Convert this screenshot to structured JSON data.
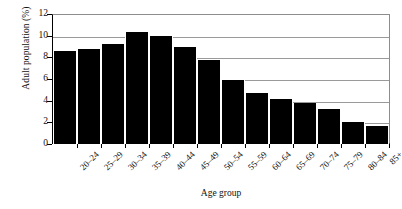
{
  "chart_data": {
    "type": "bar",
    "title": "",
    "xlabel": "Age group",
    "ylabel": "Adult population (%)",
    "categories": [
      "20–24",
      "25–29",
      "30–34",
      "35–39",
      "40–44",
      "45–49",
      "50–54",
      "55–59",
      "60–64",
      "65–69",
      "70–74",
      "75–79",
      "80–84",
      "85+"
    ],
    "values": [
      8.6,
      8.8,
      9.25,
      10.3,
      10.0,
      8.95,
      7.8,
      5.9,
      4.75,
      4.2,
      3.8,
      3.25,
      2.0,
      1.65
    ],
    "ylim": [
      0,
      12
    ],
    "yticks": [
      0,
      2,
      4,
      6,
      8,
      10,
      12
    ],
    "ytick_labels": [
      "0",
      "2",
      "4",
      "6",
      "8",
      "10",
      "12"
    ],
    "grid": true,
    "grid_axis": "y",
    "legend": "none",
    "bar_color": "#000000",
    "plot_background": "#ffffff",
    "axis_color": "#000000",
    "grid_color": "#9a9a9a"
  }
}
